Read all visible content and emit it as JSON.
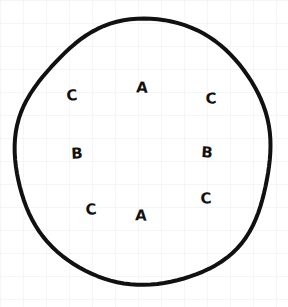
{
  "canvas": {
    "width": 288,
    "height": 307,
    "background_color": "#ffffff",
    "paper": "graph-paper",
    "grid": {
      "visible": true,
      "spacing_px": 23,
      "line_color": "#f1f2f4"
    }
  },
  "figure": {
    "shape": {
      "name": "circle",
      "style": "hand-drawn",
      "stroke_color": "#111111",
      "stroke_width_px": 4,
      "fill": "none",
      "center_x": 144,
      "center_y": 153,
      "radius_x": 129,
      "radius_y": 132
    },
    "labels": [
      {
        "text": "C",
        "x": 72,
        "y": 96,
        "rotate": -4
      },
      {
        "text": "A",
        "x": 142,
        "y": 88,
        "rotate": 3
      },
      {
        "text": "C",
        "x": 211,
        "y": 99,
        "rotate": -2
      },
      {
        "text": "B",
        "x": 77,
        "y": 154,
        "rotate": -3
      },
      {
        "text": "B",
        "x": 207,
        "y": 153,
        "rotate": 4
      },
      {
        "text": "C",
        "x": 91,
        "y": 210,
        "rotate": -5
      },
      {
        "text": "A",
        "x": 141,
        "y": 216,
        "rotate": 2
      },
      {
        "text": "C",
        "x": 206,
        "y": 199,
        "rotate": -3
      }
    ]
  },
  "chart_data": {
    "type": "scatter",
    "title": "",
    "xlabel": "",
    "ylabel": "",
    "xlim": [
      0,
      288
    ],
    "ylim": [
      0,
      307
    ],
    "grid": true,
    "legend": "none",
    "annotations": [
      {
        "label": "C",
        "x": 72,
        "y": 96
      },
      {
        "label": "A",
        "x": 142,
        "y": 88
      },
      {
        "label": "C",
        "x": 211,
        "y": 99
      },
      {
        "label": "B",
        "x": 77,
        "y": 154
      },
      {
        "label": "B",
        "x": 207,
        "y": 153
      },
      {
        "label": "C",
        "x": 91,
        "y": 210
      },
      {
        "label": "A",
        "x": 141,
        "y": 216
      },
      {
        "label": "C",
        "x": 206,
        "y": 199
      }
    ],
    "label_counts": {
      "A": 2,
      "B": 2,
      "C": 4
    },
    "boundary": {
      "shape": "circle",
      "center": [
        144,
        153
      ],
      "radius": 130
    }
  }
}
